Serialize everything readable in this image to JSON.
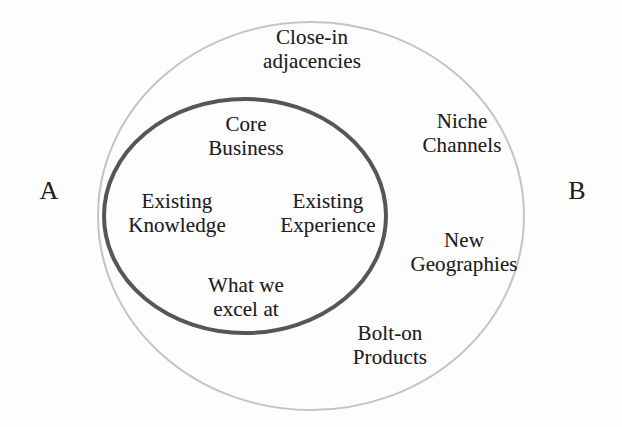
{
  "figure": {
    "background_color": "#fdfdfd",
    "text_color": "#1f1f1f"
  },
  "shapes": {
    "outer_ellipse": {
      "name": "adjacency-ellipse",
      "stroke_color": "#c4c4c4",
      "stroke_width": 2,
      "fill": "none",
      "cx": 311,
      "cy": 216,
      "rx": 213,
      "ry": 194
    },
    "inner_ellipse": {
      "name": "core-business-ellipse",
      "stroke_color": "#565656",
      "stroke_width": 4,
      "fill": "none",
      "cx": 245,
      "cy": 216,
      "rx": 141,
      "ry": 117
    }
  },
  "side_labels": {
    "left": "A",
    "right": "B"
  },
  "core_labels": [
    {
      "id": "core-business",
      "text": "Core\nBusiness"
    },
    {
      "id": "existing-knowledge",
      "text": "Existing\nKnowledge"
    },
    {
      "id": "existing-experience",
      "text": "Existing\nExperience"
    },
    {
      "id": "what-we-excel-at",
      "text": "What we\nexcel at"
    }
  ],
  "adjacency_labels": [
    {
      "id": "close-in-adjacencies",
      "text": "Close-in\nadjacencies"
    },
    {
      "id": "niche-channels",
      "text": "Niche\nChannels"
    },
    {
      "id": "new-geographies",
      "text": "New\nGeographies"
    },
    {
      "id": "bolt-on-products",
      "text": "Bolt-on\nProducts"
    }
  ]
}
